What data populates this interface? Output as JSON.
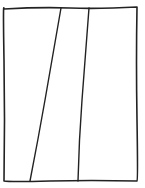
{
  "diagram": {
    "type": "hand-drawn sketch",
    "stroke_color": "#222222",
    "background": "#ffffff",
    "frame": {
      "x1": 4,
      "y1": 8,
      "x2": 137,
      "y2": 181
    },
    "dividers": [
      {
        "top_x": 61,
        "top_y": 8,
        "bottom_x": 30,
        "bottom_y": 181
      },
      {
        "top_x": 89,
        "top_y": 8,
        "bottom_x": 78,
        "bottom_y": 181
      }
    ],
    "panels": [
      "left-panel",
      "middle-panel",
      "right-panel"
    ]
  }
}
